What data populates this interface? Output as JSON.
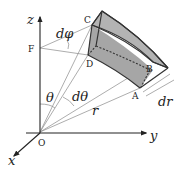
{
  "diagram": {
    "axes": {
      "z_label": "z",
      "y_label": "y",
      "x_label": "x",
      "origin_label": "O"
    },
    "points": {
      "F": "F",
      "C": "C",
      "D": "D",
      "A": "A",
      "B": "B"
    },
    "quantities": {
      "theta": "θ",
      "d_theta": "dθ",
      "d_phi": "dφ",
      "r": "r",
      "dr": "dr"
    },
    "colors": {
      "face_fill": "#a6a6a6",
      "top_fill": "#b3b3b3",
      "line": "#333333",
      "construction_line": "#8a8a8a"
    }
  }
}
